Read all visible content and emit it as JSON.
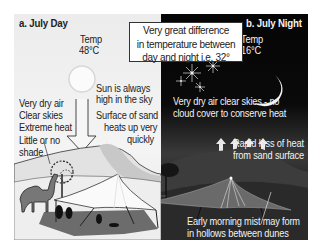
{
  "day": {
    "title": "a. July Day",
    "temp_label": "Temp",
    "temp_value": "48°C",
    "labels": {
      "sun": [
        "Sun is always",
        "high in the sky"
      ],
      "conditions": [
        "Very dry air",
        "Clear skies",
        "Extreme heat"
      ],
      "shade": [
        "Little or no",
        "shade"
      ],
      "sand": [
        "Surface of sand",
        "heats up very",
        "quickly"
      ]
    },
    "colors": {
      "background": "#ececec",
      "dune": "#d8d8d8",
      "tent": "#f8f8f8",
      "shadow": "#555555"
    }
  },
  "night": {
    "title": "b. July Night",
    "temp_label": "Temp",
    "temp_value": "16°C",
    "labels": {
      "sky": [
        "Very dry air clear skies - no",
        "cloud cover to conserve heat"
      ],
      "heat_loss": [
        "Rapid loss of heat",
        "from sand surface"
      ],
      "mist": [
        "Early morning mist may form",
        "in hollows between dunes"
      ]
    },
    "colors": {
      "background": "#050505",
      "dune": "#3a3a3a",
      "text": "#f2f2f2"
    }
  },
  "callout": {
    "lines": [
      "Very great difference",
      "in temperature between",
      "day and night i.e. 32°"
    ]
  },
  "icons": [
    "sun-icon",
    "moon-icon",
    "star-icon",
    "arrow-down-icon",
    "arrow-up-icon",
    "camel-icon",
    "tree-icon",
    "tent-icon"
  ]
}
